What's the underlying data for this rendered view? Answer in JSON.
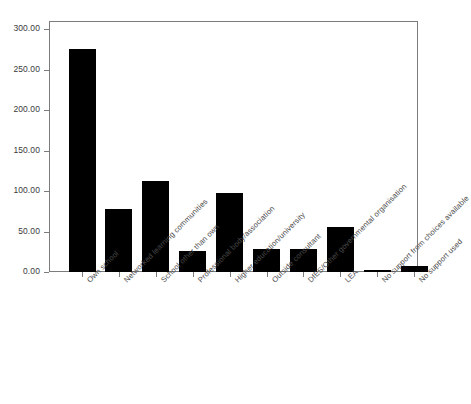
{
  "chart_data": {
    "type": "bar",
    "title": "",
    "subtitle": "",
    "xlabel": "",
    "ylabel": "",
    "ylim": [
      0,
      300
    ],
    "grid": false,
    "legend": false,
    "legend_position": "none",
    "bar_color": "#000000",
    "axis_color": "#7c7c7c",
    "tick_label_color": "#3a3a3a",
    "x_tick_rotation": -45,
    "y_ticks": [
      "0.00",
      "50.00",
      "100.00",
      "150.00",
      "200.00",
      "250.00",
      "300.00"
    ],
    "y_tick_values": [
      0,
      50,
      100,
      150,
      200,
      250,
      300
    ],
    "categories": [
      "Own school",
      "Networked learning communities",
      "School other than own",
      "Professional body/association",
      "Higher education/university",
      "Outside consultant",
      "DfES/Other governmental organisation",
      "LEA",
      "No support from choices available",
      "No support used"
    ],
    "values": [
      275,
      78,
      112,
      26,
      97,
      29,
      28,
      56,
      2,
      8
    ]
  }
}
